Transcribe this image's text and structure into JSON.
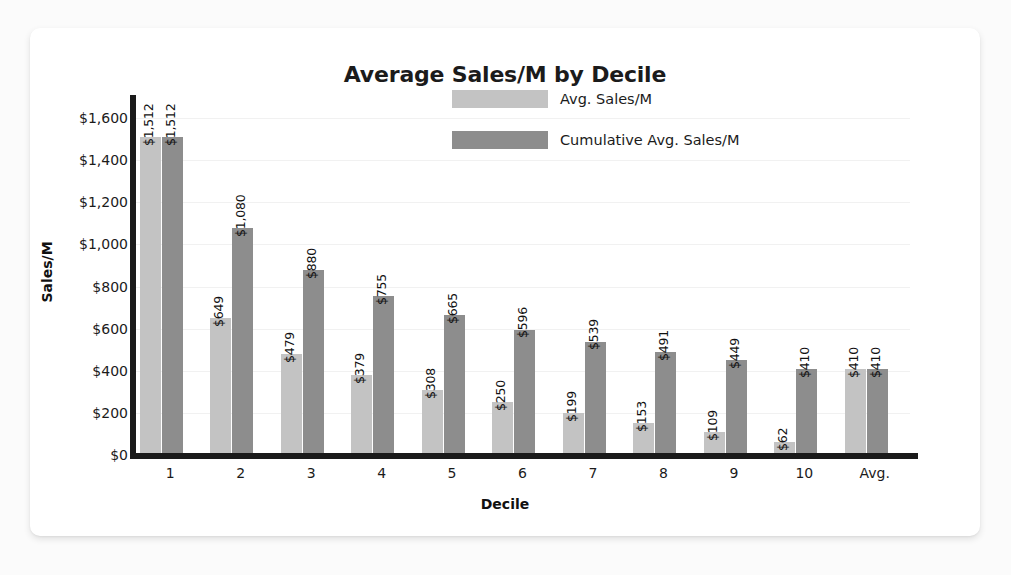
{
  "chart_data": {
    "type": "bar",
    "title": "Average Sales/M by Decile",
    "xlabel": "Decile",
    "ylabel": "Sales/M",
    "categories": [
      "1",
      "2",
      "3",
      "4",
      "5",
      "6",
      "7",
      "8",
      "9",
      "10",
      "Avg."
    ],
    "series": [
      {
        "name": "Avg. Sales/M",
        "color": "#c3c3c3",
        "values": [
          1512,
          649,
          479,
          379,
          308,
          250,
          199,
          153,
          109,
          62,
          410
        ],
        "labels": [
          "$1,512",
          "$649",
          "$479",
          "$379",
          "$308",
          "$250",
          "$199",
          "$153",
          "$109",
          "$62",
          "$410"
        ]
      },
      {
        "name": "Cumulative Avg. Sales/M",
        "color": "#8d8d8d",
        "values": [
          1512,
          1080,
          880,
          755,
          665,
          596,
          539,
          491,
          449,
          410,
          410
        ],
        "labels": [
          "$1,512",
          "$1,080",
          "$880",
          "$755",
          "$665",
          "$596",
          "$539",
          "$491",
          "$449",
          "$410",
          "$410"
        ]
      }
    ],
    "ylim": [
      0,
      1700
    ],
    "yticks": [
      0,
      200,
      400,
      600,
      800,
      1000,
      1200,
      1400,
      1600
    ],
    "ytick_labels": [
      "$0",
      "$200",
      "$400",
      "$600",
      "$800",
      "$1,000",
      "$1,200",
      "$1,400",
      "$1,600"
    ],
    "grid": true,
    "legend_position": "top-center"
  }
}
